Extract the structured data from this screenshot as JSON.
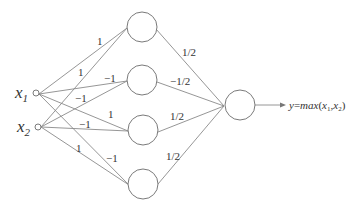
{
  "diagram": {
    "inputs": [
      {
        "id": "x1",
        "symbol": "x",
        "subscript": "1"
      },
      {
        "id": "x2",
        "symbol": "x",
        "subscript": "2"
      }
    ],
    "hidden_nodes": 4,
    "input_to_hidden_weights": {
      "x1": [
        "1",
        "-1",
        "1",
        "-1"
      ],
      "x2": [
        "1",
        "-1",
        "1",
        "-1"
      ]
    },
    "labels_near_edges": {
      "x1_h1": "1",
      "x2_h1": "1",
      "x1_h2": "−1",
      "x2_h2": "−1",
      "x1_h3": "1",
      "x2_h3": "−1",
      "x1_h4": "−1",
      "x2_h4": "1"
    },
    "hidden_to_output_weights": [
      "1/2",
      "−1/2",
      "1/2",
      "1/2"
    ],
    "output": {
      "label": "y=max(x₁, x₂)",
      "y": "y",
      "eq": "=",
      "func": "max",
      "open": "(",
      "arg1": "x",
      "arg1_sub": "1",
      "comma": ",",
      "arg2": "x",
      "arg2_sub": "2",
      "close": ")"
    }
  }
}
